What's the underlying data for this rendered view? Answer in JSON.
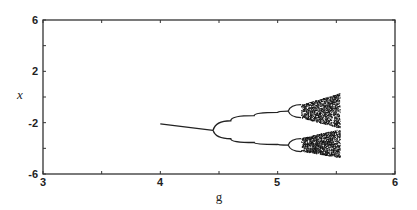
{
  "chart_data": {
    "type": "scatter",
    "title": "",
    "subtitle": "",
    "xlabel": "g",
    "ylabel": "x",
    "xlim": [
      3,
      6
    ],
    "ylim": [
      -6,
      6
    ],
    "xticks": [
      3,
      4,
      5,
      6
    ],
    "xminor_ticks": [
      3.5,
      4.5,
      5.5
    ],
    "yticks": [
      6,
      2,
      -2,
      -6
    ],
    "yminor_ticks": [
      4,
      0,
      -4
    ],
    "grid": false,
    "legend": null,
    "fixed_point_branch": [
      {
        "g": 4.0,
        "x": -2.1
      },
      {
        "g": 4.45,
        "x": -2.6
      }
    ],
    "period2_bifurcation_g": 4.45,
    "period2_upper": [
      {
        "g": 4.45,
        "x": -2.6
      },
      {
        "g": 4.6,
        "x": -1.85
      },
      {
        "g": 4.8,
        "x": -1.45
      },
      {
        "g": 5.0,
        "x": -1.2
      },
      {
        "g": 5.09,
        "x": -1.1
      }
    ],
    "period2_lower": [
      {
        "g": 4.45,
        "x": -2.6
      },
      {
        "g": 4.6,
        "x": -3.25
      },
      {
        "g": 4.8,
        "x": -3.55
      },
      {
        "g": 5.0,
        "x": -3.7
      },
      {
        "g": 5.09,
        "x": -3.75
      }
    ],
    "period4_bifurcation_g": 5.09,
    "chaos_onset_g": 5.2,
    "chaos_end_g": 5.53,
    "chaos_upper_band": {
      "top": [
        [
          5.2,
          -0.6
        ],
        [
          5.53,
          0.3
        ]
      ],
      "bottom": [
        [
          5.2,
          -1.6
        ],
        [
          5.53,
          -2.4
        ]
      ]
    },
    "chaos_lower_band": {
      "top": [
        [
          5.2,
          -3.2
        ],
        [
          5.53,
          -2.5
        ]
      ],
      "bottom": [
        [
          5.2,
          -4.2
        ],
        [
          5.53,
          -4.7
        ]
      ]
    }
  },
  "axes": {
    "x_tick_labels": [
      "3",
      "4",
      "5",
      "6"
    ],
    "y_tick_labels": [
      "6",
      "2",
      "-2",
      "-6"
    ],
    "xlabel": "g",
    "ylabel": "x"
  }
}
